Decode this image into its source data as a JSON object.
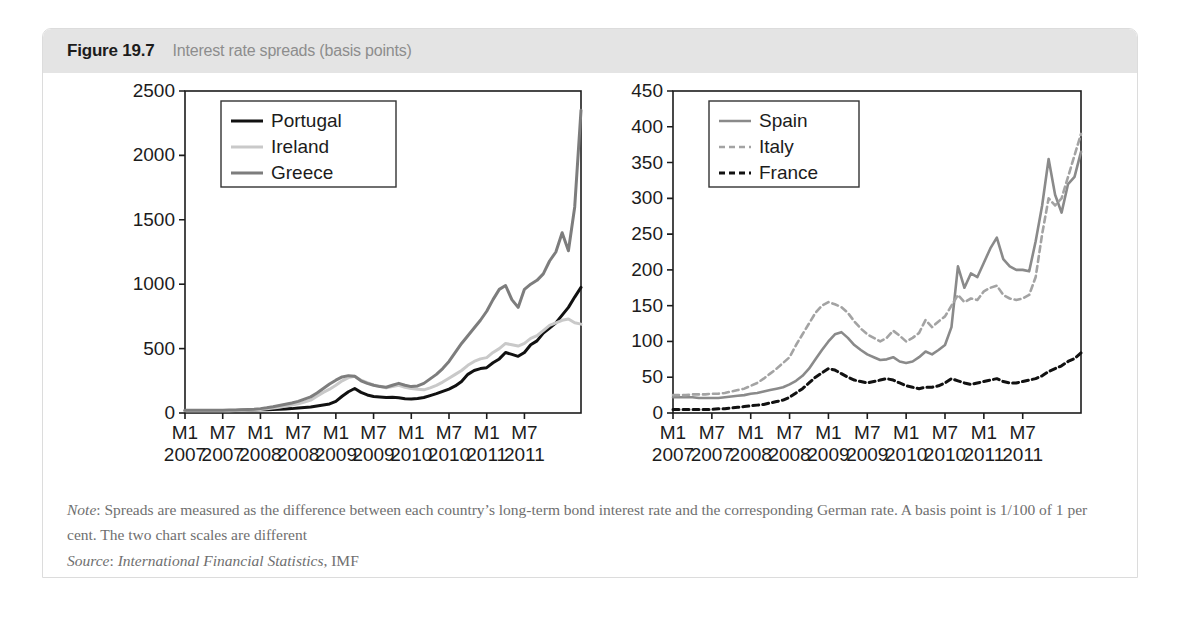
{
  "figure": {
    "number": "Figure 19.7",
    "caption": "Interest rate spreads (basis points)",
    "note_label": "Note",
    "note_text": ": Spreads are measured as the difference between each country’s long-term bond interest rate and the corresponding German rate. A basis point is 1/100 of 1 per cent. The two chart scales are different",
    "source_label": "Source",
    "source_italic": "International Financial Statistics",
    "source_rest": ", IMF"
  },
  "colors": {
    "header_band": "#e4e4e4",
    "caption_gray": "#8d8d8d",
    "portugal": "#111111",
    "ireland": "#c9c9c9",
    "greece": "#7d7d7d",
    "spain": "#8a8a8a",
    "italy": "#a3a3a3",
    "france": "#111111",
    "axis": "#1c1c1c",
    "note_text": "#6f6f6f"
  },
  "chart_data": [
    {
      "id": "left",
      "type": "line",
      "title": "",
      "xlabel": "",
      "ylabel": "",
      "ylim": [
        0,
        2500
      ],
      "yticks": [
        0,
        500,
        1000,
        1500,
        2000,
        2500
      ],
      "xticks": [
        {
          "month": "M1",
          "year": "2007"
        },
        {
          "month": "M7",
          "year": "2007"
        },
        {
          "month": "M1",
          "year": "2008"
        },
        {
          "month": "M7",
          "year": "2008"
        },
        {
          "month": "M1",
          "year": "2009"
        },
        {
          "month": "M7",
          "year": "2009"
        },
        {
          "month": "M1",
          "year": "2010"
        },
        {
          "month": "M7",
          "year": "2010"
        },
        {
          "month": "M1",
          "year": "2011"
        },
        {
          "month": "M7",
          "year": "2011"
        }
      ],
      "grid": false,
      "legend_position": "top-left",
      "series": [
        {
          "name": "Portugal",
          "color": "#111111",
          "style": "solid",
          "width": 3,
          "values": [
            20,
            20,
            20,
            20,
            20,
            20,
            20,
            20,
            20,
            22,
            22,
            24,
            25,
            26,
            28,
            30,
            32,
            34,
            38,
            42,
            46,
            55,
            62,
            70,
            90,
            130,
            165,
            190,
            160,
            140,
            128,
            125,
            120,
            122,
            118,
            110,
            108,
            112,
            120,
            135,
            150,
            168,
            186,
            210,
            245,
            300,
            330,
            345,
            352,
            390,
            420,
            470,
            455,
            440,
            470,
            530,
            560,
            620,
            660,
            700,
            760,
            820,
            900,
            975
          ]
        },
        {
          "name": "Ireland",
          "color": "#c9c9c9",
          "style": "solid",
          "width": 3,
          "values": [
            18,
            18,
            18,
            18,
            18,
            18,
            18,
            18,
            19,
            20,
            22,
            24,
            28,
            32,
            38,
            45,
            55,
            62,
            72,
            85,
            100,
            130,
            160,
            185,
            215,
            250,
            275,
            285,
            255,
            235,
            218,
            208,
            195,
            205,
            215,
            200,
            190,
            185,
            180,
            195,
            215,
            240,
            270,
            300,
            330,
            370,
            400,
            420,
            430,
            470,
            500,
            540,
            530,
            520,
            540,
            580,
            600,
            640,
            680,
            700,
            720,
            730,
            700,
            690
          ]
        },
        {
          "name": "Greece",
          "color": "#7d7d7d",
          "style": "solid",
          "width": 3,
          "values": [
            22,
            22,
            22,
            22,
            22,
            22,
            22,
            23,
            24,
            26,
            28,
            30,
            34,
            40,
            48,
            58,
            68,
            78,
            90,
            108,
            125,
            155,
            190,
            225,
            255,
            280,
            290,
            285,
            250,
            230,
            215,
            205,
            200,
            215,
            230,
            215,
            205,
            210,
            230,
            265,
            300,
            345,
            400,
            470,
            540,
            600,
            660,
            720,
            790,
            880,
            960,
            990,
            880,
            820,
            960,
            1000,
            1030,
            1080,
            1180,
            1250,
            1400,
            1260,
            1600,
            2350
          ]
        }
      ]
    },
    {
      "id": "right",
      "type": "line",
      "title": "",
      "xlabel": "",
      "ylabel": "",
      "ylim": [
        0,
        450
      ],
      "yticks": [
        0,
        50,
        100,
        150,
        200,
        250,
        300,
        350,
        400,
        450
      ],
      "xticks": [
        {
          "month": "M1",
          "year": "2007"
        },
        {
          "month": "M7",
          "year": "2007"
        },
        {
          "month": "M1",
          "year": "2008"
        },
        {
          "month": "M7",
          "year": "2008"
        },
        {
          "month": "M1",
          "year": "2009"
        },
        {
          "month": "M7",
          "year": "2009"
        },
        {
          "month": "M1",
          "year": "2010"
        },
        {
          "month": "M7",
          "year": "2010"
        },
        {
          "month": "M1",
          "year": "2011"
        },
        {
          "month": "M7",
          "year": "2011"
        }
      ],
      "grid": false,
      "legend_position": "top-left",
      "series": [
        {
          "name": "Spain",
          "color": "#8a8a8a",
          "style": "solid",
          "width": 2.6,
          "values": [
            22,
            22,
            22,
            22,
            21,
            21,
            21,
            21,
            22,
            23,
            24,
            25,
            27,
            28,
            30,
            32,
            34,
            36,
            40,
            45,
            52,
            62,
            75,
            88,
            100,
            110,
            113,
            105,
            95,
            88,
            82,
            78,
            74,
            75,
            78,
            72,
            70,
            72,
            78,
            86,
            82,
            88,
            95,
            120,
            205,
            175,
            195,
            190,
            210,
            230,
            245,
            215,
            205,
            200,
            200,
            198,
            240,
            290,
            355,
            305,
            280,
            320,
            330,
            365
          ]
        },
        {
          "name": "Italy",
          "color": "#a3a3a3",
          "style": "dashed",
          "width": 2.6,
          "values": [
            25,
            25,
            25,
            26,
            26,
            26,
            27,
            27,
            28,
            30,
            32,
            34,
            38,
            42,
            48,
            55,
            62,
            70,
            78,
            95,
            110,
            125,
            140,
            150,
            155,
            152,
            148,
            140,
            128,
            118,
            110,
            105,
            100,
            105,
            115,
            108,
            100,
            105,
            112,
            130,
            120,
            128,
            135,
            150,
            165,
            155,
            160,
            158,
            170,
            175,
            178,
            165,
            160,
            158,
            160,
            165,
            190,
            250,
            300,
            290,
            300,
            330,
            360,
            390
          ]
        },
        {
          "name": "France",
          "color": "#111111",
          "style": "dashed",
          "width": 3,
          "values": [
            5,
            5,
            5,
            5,
            5,
            5,
            5,
            6,
            6,
            7,
            8,
            9,
            10,
            11,
            12,
            14,
            16,
            18,
            22,
            28,
            34,
            42,
            50,
            56,
            62,
            60,
            55,
            50,
            46,
            44,
            42,
            44,
            46,
            48,
            46,
            42,
            38,
            36,
            34,
            36,
            36,
            38,
            42,
            48,
            45,
            42,
            40,
            42,
            44,
            46,
            48,
            44,
            42,
            42,
            44,
            46,
            48,
            52,
            58,
            62,
            66,
            72,
            76,
            84
          ]
        }
      ]
    }
  ]
}
